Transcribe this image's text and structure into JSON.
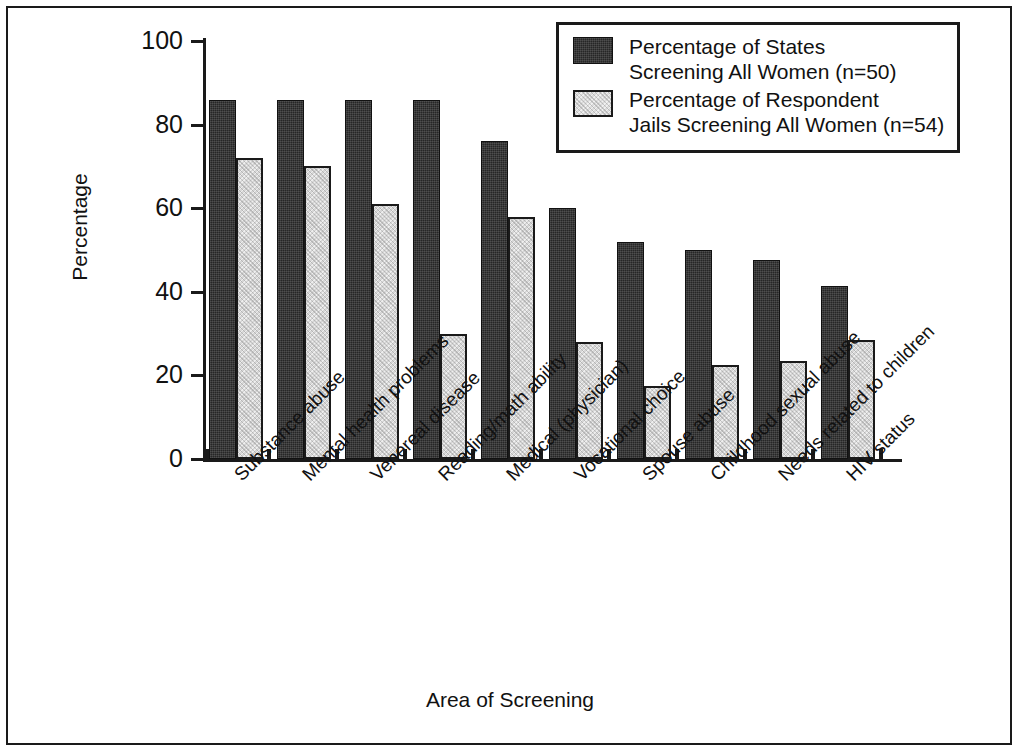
{
  "chart_data": {
    "type": "bar",
    "title": "",
    "xlabel": "Area of Screening",
    "ylabel": "Percentage",
    "ylim": [
      0,
      100
    ],
    "yticks": [
      0,
      20,
      40,
      60,
      80,
      100
    ],
    "grid": false,
    "legend_position": "top-right",
    "categories": [
      "Substance abuse",
      "Mental health problems",
      "Venereal disease",
      "Reading/math ability",
      "Medical (physician)",
      "Vocational choice",
      "Spouse abuse",
      "Childhood sexual abuse",
      "Needs related to children",
      "HIV status"
    ],
    "series": [
      {
        "name": "Percentage of States Screening All Women (n=50)",
        "color": "#262626",
        "values": [
          86,
          86,
          86,
          86,
          76,
          60,
          52,
          50,
          47.5,
          41.5
        ]
      },
      {
        "name": "Percentage of Respondent Jails Screening All Women (n=54)",
        "color": "#d6d6d6",
        "values": [
          72,
          70,
          61,
          30,
          58,
          28,
          17.5,
          22.5,
          23.5,
          28.5
        ]
      }
    ]
  },
  "legend": {
    "entries": [
      {
        "swatch": "dark",
        "line1": "Percentage of States",
        "line2": "Screening All Women (n=50)"
      },
      {
        "swatch": "light",
        "line1": "Percentage of Respondent",
        "line2": "Jails Screening All Women (n=54)"
      }
    ]
  },
  "axes": {
    "y_title": "Percentage",
    "x_title": "Area of Screening",
    "y_tick_labels": [
      "100",
      "80",
      "60",
      "40",
      "20",
      "0"
    ]
  }
}
